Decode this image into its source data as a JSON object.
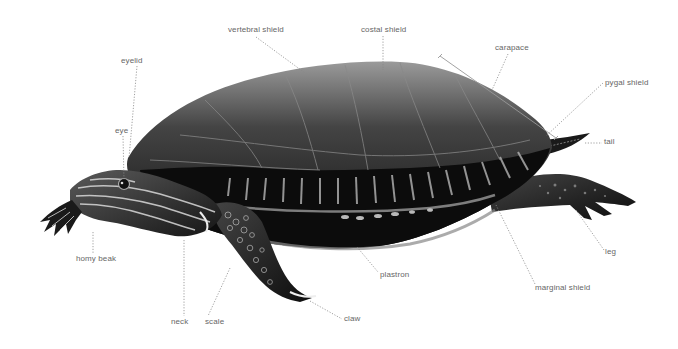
{
  "diagram": {
    "background_color": "#ffffff",
    "label_color": "#666666",
    "leader_color": "#888888",
    "labels": [
      {
        "id": "vertebral-shield",
        "text": "vertebral shield"
      },
      {
        "id": "costal-shield",
        "text": "costal shield"
      },
      {
        "id": "eyelid",
        "text": "eyelid"
      },
      {
        "id": "eye",
        "text": "eye"
      },
      {
        "id": "carapace",
        "text": "carapace"
      },
      {
        "id": "pygal-shield",
        "text": "pygal shield"
      },
      {
        "id": "tail",
        "text": "tail"
      },
      {
        "id": "horny-beak",
        "text": "homy beak"
      },
      {
        "id": "neck",
        "text": "neck"
      },
      {
        "id": "scale",
        "text": "scale"
      },
      {
        "id": "claw",
        "text": "claw"
      },
      {
        "id": "plastron",
        "text": "plastron"
      },
      {
        "id": "marginal-shield",
        "text": "marginal shield"
      },
      {
        "id": "leg",
        "text": "leg"
      }
    ]
  }
}
